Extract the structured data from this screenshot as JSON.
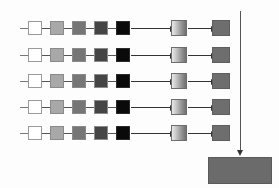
{
  "figure": {
    "background_color": "#fdfdfd",
    "width": 279,
    "height": 188
  },
  "palette": {
    "chain_step_colors": [
      "#ffffff",
      "#a8a8a8",
      "#767676",
      "#454545",
      "#0a0a0a"
    ],
    "gradient_box_from": "#e8e8e8",
    "gradient_box_to": "#6f6f6f",
    "output_box_color": "#6e6e6e",
    "aggregate_box_color": "#6b6b6b",
    "connector_color": "#555555",
    "arrow_color": "#333333"
  },
  "geometry": {
    "row_y_tops": [
      21,
      48,
      74,
      100,
      126
    ],
    "row_count": 5,
    "chain_box_size": 14,
    "chain_box_x": [
      28,
      50,
      72,
      94,
      116
    ],
    "stub_x": 20,
    "stub_width": 8,
    "long_arrow_x": 131,
    "long_arrow_width": 39,
    "gradient_box_x": 171,
    "gradient_box_width": 16,
    "short_arrow_x": 188,
    "short_arrow_width": 23,
    "output_box_x": 212,
    "output_box_width": 18,
    "vline_x": 240,
    "vline_top": 11,
    "vline_bottom": 150,
    "aggregate_x": 208,
    "aggregate_y": 157,
    "aggregate_width": 64,
    "aggregate_height": 27
  },
  "rows": [
    {
      "id": "row-1",
      "chain": [
        {
          "step": 1,
          "label": "stage-1",
          "color": "#ffffff"
        },
        {
          "step": 2,
          "label": "stage-2",
          "color": "#a8a8a8"
        },
        {
          "step": 3,
          "label": "stage-3",
          "color": "#767676"
        },
        {
          "step": 4,
          "label": "stage-4",
          "color": "#454545"
        },
        {
          "step": 5,
          "label": "stage-5",
          "color": "#0a0a0a"
        }
      ],
      "transform_label": "gradient-stage",
      "output_label": "row-output"
    },
    {
      "id": "row-2",
      "chain": [
        {
          "step": 1,
          "label": "stage-1",
          "color": "#ffffff"
        },
        {
          "step": 2,
          "label": "stage-2",
          "color": "#a8a8a8"
        },
        {
          "step": 3,
          "label": "stage-3",
          "color": "#767676"
        },
        {
          "step": 4,
          "label": "stage-4",
          "color": "#454545"
        },
        {
          "step": 5,
          "label": "stage-5",
          "color": "#0a0a0a"
        }
      ],
      "transform_label": "gradient-stage",
      "output_label": "row-output"
    },
    {
      "id": "row-3",
      "chain": [
        {
          "step": 1,
          "label": "stage-1",
          "color": "#ffffff"
        },
        {
          "step": 2,
          "label": "stage-2",
          "color": "#a8a8a8"
        },
        {
          "step": 3,
          "label": "stage-3",
          "color": "#767676"
        },
        {
          "step": 4,
          "label": "stage-4",
          "color": "#454545"
        },
        {
          "step": 5,
          "label": "stage-5",
          "color": "#0a0a0a"
        }
      ],
      "transform_label": "gradient-stage",
      "output_label": "row-output"
    },
    {
      "id": "row-4",
      "chain": [
        {
          "step": 1,
          "label": "stage-1",
          "color": "#ffffff"
        },
        {
          "step": 2,
          "label": "stage-2",
          "color": "#a8a8a8"
        },
        {
          "step": 3,
          "label": "stage-3",
          "color": "#767676"
        },
        {
          "step": 4,
          "label": "stage-4",
          "color": "#454545"
        },
        {
          "step": 5,
          "label": "stage-5",
          "color": "#0a0a0a"
        }
      ],
      "transform_label": "gradient-stage",
      "output_label": "row-output"
    },
    {
      "id": "row-5",
      "chain": [
        {
          "step": 1,
          "label": "stage-1",
          "color": "#ffffff"
        },
        {
          "step": 2,
          "label": "stage-2",
          "color": "#a8a8a8"
        },
        {
          "step": 3,
          "label": "stage-3",
          "color": "#767676"
        },
        {
          "step": 4,
          "label": "stage-4",
          "color": "#454545"
        },
        {
          "step": 5,
          "label": "stage-5",
          "color": "#0a0a0a"
        }
      ],
      "transform_label": "gradient-stage",
      "output_label": "row-output"
    }
  ],
  "aggregate": {
    "label": "aggregate-result"
  }
}
